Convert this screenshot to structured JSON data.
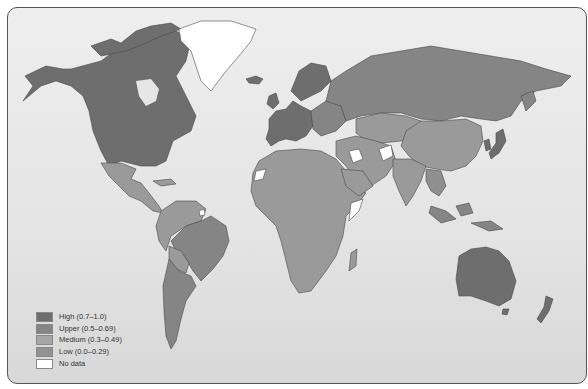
{
  "map": {
    "type": "choropleth",
    "subject": "World map with countries shaded by index category",
    "colors": {
      "high": "#6e6e6e",
      "upper": "#858585",
      "medium": "#9a9a9a",
      "low": "#8f8f8f",
      "no_data": "#ffffff",
      "ocean": "#e6e6e6",
      "border": "#444444"
    },
    "regions": [
      {
        "name": "North America (Canada, USA)",
        "category": "High"
      },
      {
        "name": "Greenland",
        "category": "No data"
      },
      {
        "name": "Mexico / Central America",
        "category": "Medium"
      },
      {
        "name": "Brazil",
        "category": "Upper"
      },
      {
        "name": "Argentina / Chile",
        "category": "Upper"
      },
      {
        "name": "Western Europe",
        "category": "High"
      },
      {
        "name": "Russia",
        "category": "Upper"
      },
      {
        "name": "Africa",
        "category": "Medium"
      },
      {
        "name": "Middle East / Central Asia",
        "category": "Medium"
      },
      {
        "name": "Iraq",
        "category": "No data"
      },
      {
        "name": "Afghanistan",
        "category": "No data"
      },
      {
        "name": "Somalia",
        "category": "No data"
      },
      {
        "name": "Western Sahara",
        "category": "No data"
      },
      {
        "name": "China",
        "category": "Medium"
      },
      {
        "name": "Japan",
        "category": "High"
      },
      {
        "name": "Australia",
        "category": "High"
      },
      {
        "name": "New Zealand",
        "category": "High"
      }
    ]
  },
  "legend": {
    "items": [
      {
        "label": "High (0.7–1.0)",
        "color": "#6e6e6e"
      },
      {
        "label": "Upper (0.5–0.69)",
        "color": "#858585"
      },
      {
        "label": "Medium (0.3–0.49)",
        "color": "#a6a6a6"
      },
      {
        "label": "Low (0.0–0.29)",
        "color": "#929292"
      },
      {
        "label": "No data",
        "color": "#ffffff"
      }
    ]
  }
}
